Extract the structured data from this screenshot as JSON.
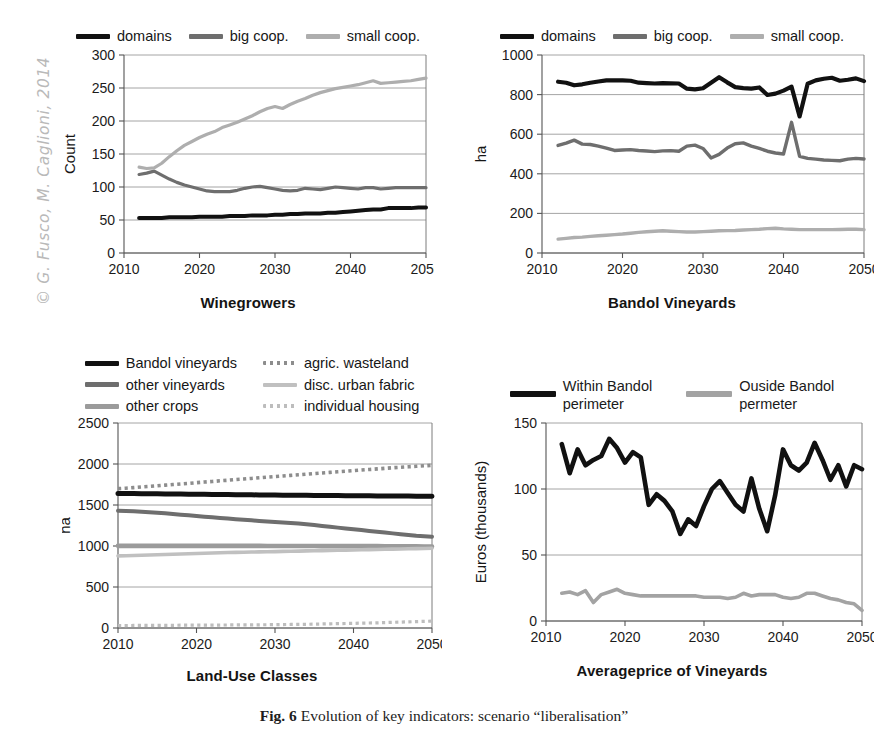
{
  "watermark": {
    "text": "© G. Fusco, M. Caglioni, 2014"
  },
  "caption": {
    "label": "Fig. 6",
    "body": "Evolution of key indicators: scenario “liberalisation”"
  },
  "colors": {
    "black": "#111111",
    "dark_grey": "#6e6e6e",
    "mid_grey": "#8d8d8d",
    "light_grey": "#b4b4b4",
    "pale_grey": "#c9c9c9",
    "grid": "#9a9a9a",
    "axis": "#555555"
  },
  "panels": {
    "top_left": {
      "legend": [
        {
          "label": "domains",
          "color": "#111111",
          "style": "solid"
        },
        {
          "label": "big coop.",
          "color": "#6e6e6e",
          "style": "solid"
        },
        {
          "label": "small coop.",
          "color": "#aeaeae",
          "style": "solid"
        }
      ],
      "xtitle": "Winegrowers"
    },
    "top_right": {
      "legend": [
        {
          "label": "domains",
          "color": "#111111",
          "style": "solid"
        },
        {
          "label": "big coop.",
          "color": "#6e6e6e",
          "style": "solid"
        },
        {
          "label": "small coop.",
          "color": "#aeaeae",
          "style": "solid"
        }
      ],
      "xtitle": "Bandol Vineyards"
    },
    "bottom_left": {
      "legend": [
        {
          "label": "Bandol vineyards",
          "color": "#111111",
          "style": "solid"
        },
        {
          "label": "agric. wasteland",
          "color": "#8d8d8d",
          "style": "dotted"
        },
        {
          "label": "other vineyards",
          "color": "#6e6e6e",
          "style": "solid"
        },
        {
          "label": "disc. urban fabric",
          "color": "#c0c0c0",
          "style": "solid"
        },
        {
          "label": "other crops",
          "color": "#9b9b9b",
          "style": "solid"
        },
        {
          "label": "individual housing",
          "color": "#bdbdbd",
          "style": "dotted"
        }
      ],
      "xtitle": "Land-Use Classes"
    },
    "bottom_right": {
      "legend": [
        {
          "label": "Within Bandol",
          "label2": "perimeter",
          "color": "#111111",
          "style": "solid"
        },
        {
          "label": "Ouside Bandol",
          "label2": "permeter",
          "color": "#a3a3a3",
          "style": "solid"
        }
      ],
      "xtitle": "Averageprice of Vineyards"
    }
  },
  "chart_data": [
    {
      "id": "winegrowers",
      "type": "line",
      "title": "Winegrowers",
      "xlabel": "Winegrowers",
      "ylabel": "Count",
      "xlim": [
        2010,
        2050
      ],
      "ylim": [
        0,
        300
      ],
      "yticks": [
        0,
        50,
        100,
        150,
        200,
        250,
        300
      ],
      "xticks": [
        2010,
        2020,
        2030,
        2040,
        2050
      ],
      "grid": true,
      "legend_position": "top",
      "x": [
        2012,
        2013,
        2014,
        2015,
        2016,
        2017,
        2018,
        2019,
        2020,
        2021,
        2022,
        2023,
        2024,
        2025,
        2026,
        2027,
        2028,
        2029,
        2030,
        2031,
        2032,
        2033,
        2034,
        2035,
        2036,
        2037,
        2038,
        2039,
        2040,
        2041,
        2042,
        2043,
        2044,
        2045,
        2046,
        2047,
        2048,
        2049,
        2050
      ],
      "series": [
        {
          "name": "domains",
          "color": "#111111",
          "values": [
            53,
            53,
            53,
            53,
            54,
            54,
            54,
            54,
            55,
            55,
            55,
            55,
            56,
            56,
            56,
            57,
            57,
            57,
            58,
            58,
            59,
            59,
            60,
            60,
            60,
            61,
            61,
            62,
            63,
            64,
            65,
            66,
            66,
            68,
            68,
            68,
            68,
            69,
            69
          ]
        },
        {
          "name": "big coop.",
          "color": "#6e6e6e",
          "values": [
            119,
            121,
            124,
            118,
            112,
            107,
            103,
            100,
            97,
            94,
            93,
            93,
            93,
            95,
            98,
            100,
            101,
            99,
            97,
            95,
            94,
            95,
            98,
            97,
            96,
            98,
            100,
            99,
            98,
            97,
            99,
            99,
            97,
            98,
            99,
            99,
            99,
            99,
            99
          ]
        },
        {
          "name": "small coop.",
          "color": "#aeaeae",
          "values": [
            130,
            128,
            129,
            136,
            146,
            155,
            163,
            169,
            175,
            180,
            184,
            190,
            194,
            198,
            203,
            208,
            214,
            219,
            222,
            219,
            225,
            230,
            234,
            239,
            243,
            246,
            249,
            251,
            253,
            255,
            258,
            261,
            257,
            258,
            259,
            260,
            261,
            263,
            265
          ]
        }
      ]
    },
    {
      "id": "bandol-vineyards",
      "type": "line",
      "title": "Bandol Vineyards",
      "xlabel": "Bandol Vineyards",
      "ylabel": "ha",
      "xlim": [
        2010,
        2050
      ],
      "ylim": [
        0,
        1000
      ],
      "yticks": [
        0,
        200,
        400,
        600,
        800,
        1000
      ],
      "xticks": [
        2010,
        2020,
        2030,
        2040,
        2050
      ],
      "grid": true,
      "legend_position": "top",
      "x": [
        2012,
        2013,
        2014,
        2015,
        2016,
        2017,
        2018,
        2019,
        2020,
        2021,
        2022,
        2023,
        2024,
        2025,
        2026,
        2027,
        2028,
        2029,
        2030,
        2031,
        2032,
        2033,
        2034,
        2035,
        2036,
        2037,
        2038,
        2039,
        2040,
        2041,
        2042,
        2043,
        2044,
        2045,
        2046,
        2047,
        2048,
        2049,
        2050
      ],
      "series": [
        {
          "name": "domains",
          "color": "#111111",
          "values": [
            865,
            860,
            847,
            852,
            860,
            866,
            872,
            872,
            872,
            870,
            860,
            858,
            856,
            858,
            857,
            856,
            830,
            826,
            832,
            860,
            888,
            862,
            838,
            833,
            830,
            836,
            798,
            805,
            820,
            840,
            690,
            855,
            872,
            880,
            885,
            870,
            875,
            882,
            868
          ]
        },
        {
          "name": "big coop.",
          "color": "#6e6e6e",
          "values": [
            543,
            555,
            570,
            550,
            548,
            540,
            530,
            518,
            520,
            522,
            518,
            515,
            512,
            516,
            517,
            514,
            540,
            545,
            528,
            480,
            498,
            530,
            552,
            556,
            540,
            528,
            514,
            505,
            500,
            660,
            488,
            478,
            474,
            470,
            468,
            466,
            474,
            478,
            475
          ]
        },
        {
          "name": "small coop.",
          "color": "#aeaeae",
          "values": [
            70,
            74,
            78,
            80,
            84,
            87,
            90,
            93,
            96,
            100,
            104,
            107,
            110,
            112,
            110,
            108,
            106,
            106,
            108,
            110,
            112,
            113,
            114,
            116,
            118,
            120,
            123,
            125,
            122,
            120,
            118,
            118,
            118,
            118,
            118,
            119,
            120,
            120,
            118
          ]
        }
      ]
    },
    {
      "id": "land-use-classes",
      "type": "line",
      "title": "Land-Use Classes",
      "xlabel": "Land-Use Classes",
      "ylabel": "ha",
      "xlim": [
        2010,
        2050
      ],
      "ylim": [
        0,
        2500
      ],
      "yticks": [
        0,
        500,
        1000,
        1500,
        2000,
        2500
      ],
      "xticks": [
        2010,
        2020,
        2030,
        2040,
        2050
      ],
      "grid": true,
      "legend_position": "top",
      "x": [
        2010,
        2011,
        2012,
        2013,
        2014,
        2015,
        2016,
        2017,
        2018,
        2019,
        2020,
        2021,
        2022,
        2023,
        2024,
        2025,
        2026,
        2027,
        2028,
        2029,
        2030,
        2031,
        2032,
        2033,
        2034,
        2035,
        2036,
        2037,
        2038,
        2039,
        2040,
        2041,
        2042,
        2043,
        2044,
        2045,
        2046,
        2047,
        2048,
        2049,
        2050
      ],
      "series": [
        {
          "name": "Bandol vineyards",
          "color": "#111111",
          "style": "solid",
          "values": [
            1640,
            1640,
            1639,
            1638,
            1637,
            1636,
            1635,
            1634,
            1633,
            1632,
            1631,
            1630,
            1629,
            1628,
            1627,
            1626,
            1625,
            1624,
            1623,
            1622,
            1621,
            1620,
            1620,
            1619,
            1618,
            1617,
            1616,
            1615,
            1615,
            1614,
            1613,
            1612,
            1612,
            1611,
            1610,
            1610,
            1609,
            1609,
            1608,
            1608,
            1607
          ]
        },
        {
          "name": "other vineyards",
          "color": "#6e6e6e",
          "style": "solid",
          "values": [
            1430,
            1428,
            1424,
            1418,
            1412,
            1405,
            1398,
            1390,
            1382,
            1374,
            1366,
            1358,
            1350,
            1342,
            1334,
            1327,
            1320,
            1313,
            1306,
            1300,
            1294,
            1288,
            1282,
            1275,
            1265,
            1255,
            1244,
            1234,
            1224,
            1214,
            1204,
            1194,
            1184,
            1174,
            1164,
            1154,
            1144,
            1134,
            1124,
            1118,
            1114
          ]
        },
        {
          "name": "other crops",
          "color": "#9b9b9b",
          "style": "solid",
          "values": [
            1002,
            1002,
            1002,
            1002,
            1002,
            1002,
            1002,
            1002,
            1002,
            1002,
            1001,
            1001,
            1001,
            1001,
            1001,
            1001,
            1001,
            1001,
            1001,
            1000,
            1000,
            1000,
            1000,
            1000,
            1000,
            1000,
            999,
            999,
            999,
            999,
            999,
            998,
            998,
            998,
            997,
            997,
            996,
            996,
            995,
            994,
            993
          ]
        },
        {
          "name": "agric. wasteland",
          "color": "#8d8d8d",
          "style": "dotted",
          "values": [
            1700,
            1705,
            1712,
            1720,
            1727,
            1734,
            1742,
            1750,
            1757,
            1764,
            1772,
            1780,
            1787,
            1795,
            1802,
            1810,
            1817,
            1824,
            1832,
            1840,
            1847,
            1854,
            1861,
            1868,
            1876,
            1884,
            1891,
            1898,
            1905,
            1912,
            1919,
            1926,
            1933,
            1940,
            1947,
            1954,
            1960,
            1966,
            1972,
            1978,
            1984
          ]
        },
        {
          "name": "disc. urban fabric",
          "color": "#c0c0c0",
          "style": "solid",
          "values": [
            880,
            882,
            884,
            887,
            890,
            893,
            896,
            899,
            902,
            905,
            908,
            911,
            914,
            917,
            920,
            922,
            924,
            926,
            928,
            930,
            932,
            934,
            936,
            938,
            940,
            942,
            944,
            946,
            948,
            950,
            952,
            954,
            956,
            958,
            960,
            962,
            964,
            966,
            968,
            970,
            972
          ]
        },
        {
          "name": "individual housing",
          "color": "#bdbdbd",
          "style": "dotted",
          "values": [
            30,
            30,
            31,
            31,
            32,
            32,
            33,
            33,
            34,
            34,
            35,
            35,
            36,
            36,
            37,
            37,
            38,
            38,
            39,
            40,
            41,
            42,
            43,
            44,
            45,
            47,
            49,
            51,
            53,
            55,
            57,
            59,
            61,
            63,
            66,
            69,
            72,
            75,
            78,
            81,
            84
          ]
        }
      ]
    },
    {
      "id": "average-price-of-vineyards",
      "type": "line",
      "title": "Averageprice of Vineyards",
      "xlabel": "Averageprice of Vineyards",
      "ylabel": "Euros (thousands)",
      "xlim": [
        2010,
        2050
      ],
      "ylim": [
        0,
        150
      ],
      "yticks": [
        0,
        50,
        100,
        150
      ],
      "xticks": [
        2010,
        2020,
        2030,
        2040,
        2050
      ],
      "grid": true,
      "legend_position": "top",
      "x": [
        2012,
        2013,
        2014,
        2015,
        2016,
        2017,
        2018,
        2019,
        2020,
        2021,
        2022,
        2023,
        2024,
        2025,
        2026,
        2027,
        2028,
        2029,
        2030,
        2031,
        2032,
        2033,
        2034,
        2035,
        2036,
        2037,
        2038,
        2039,
        2040,
        2041,
        2042,
        2043,
        2044,
        2045,
        2046,
        2047,
        2048,
        2049,
        2050
      ],
      "series": [
        {
          "name": "Within Bandol perimeter",
          "color": "#111111",
          "values": [
            134,
            112,
            130,
            118,
            122,
            125,
            138,
            131,
            120,
            128,
            124,
            88,
            96,
            91,
            83,
            66,
            77,
            72,
            87,
            100,
            106,
            97,
            88,
            83,
            108,
            85,
            68,
            95,
            130,
            118,
            114,
            120,
            135,
            122,
            107,
            118,
            102,
            118,
            115
          ]
        },
        {
          "name": "Ouside Bandol permeter",
          "color": "#a3a3a3",
          "values": [
            21,
            22,
            20,
            23,
            14,
            20,
            22,
            24,
            21,
            20,
            19,
            19,
            19,
            19,
            19,
            19,
            19,
            19,
            18,
            18,
            18,
            17,
            18,
            21,
            19,
            20,
            20,
            20,
            18,
            17,
            18,
            21,
            21,
            19,
            17,
            16,
            14,
            13,
            8
          ]
        }
      ]
    }
  ]
}
